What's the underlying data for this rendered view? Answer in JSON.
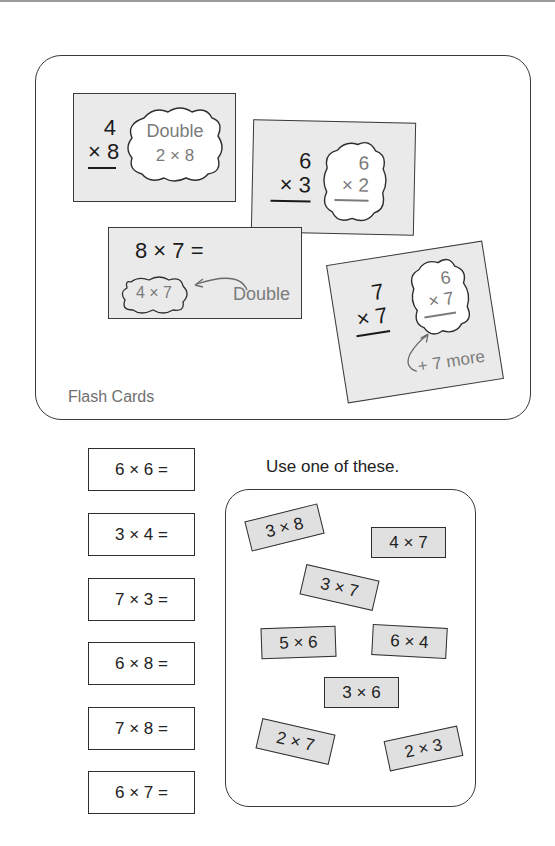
{
  "flash_cards": {
    "label": "Flash Cards",
    "cards": [
      {
        "top": "4",
        "bottom": "× 8",
        "hint_line1": "Double",
        "hint_line2": "2 × 8"
      },
      {
        "top": "6",
        "bottom": "× 3",
        "hint_top": "6",
        "hint_bottom": "× 2"
      },
      {
        "equation": "8 × 7 =",
        "hint": "4 × 7",
        "note": "Double"
      },
      {
        "top": "7",
        "bottom": "× 7",
        "hint_top": "6",
        "hint_bottom": "× 7",
        "note": "+ 7 more"
      }
    ]
  },
  "exercises": [
    {
      "expr": "6 × 6 ="
    },
    {
      "expr": "3 × 4 ="
    },
    {
      "expr": "7 × 3 ="
    },
    {
      "expr": "6 × 8 ="
    },
    {
      "expr": "7 × 8 ="
    },
    {
      "expr": "6 × 7 ="
    }
  ],
  "choices": {
    "instruction": "Use one of these.",
    "items": [
      "3 × 8",
      "4 × 7",
      "3 × 7",
      "5 × 6",
      "6 × 4",
      "3 × 6",
      "2 × 7",
      "2 × 3"
    ]
  },
  "colors": {
    "card_fill": "#eaeaea",
    "chip_fill": "#e0e0e0",
    "hint_text": "#7b7b7b",
    "outline": "#3a3a3a"
  }
}
